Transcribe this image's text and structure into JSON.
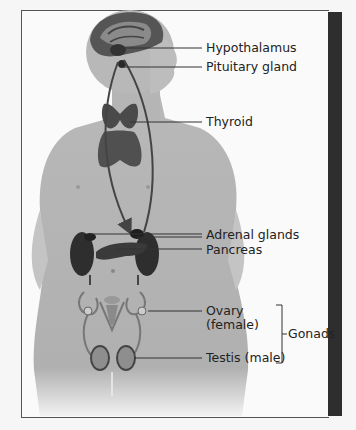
{
  "figure": {
    "type": "anatomical-diagram",
    "labels": {
      "hypothalamus": "Hypothalamus",
      "pituitary": "Pituitary gland",
      "thyroid": "Thyroid",
      "adrenal": "Adrenal glands",
      "pancreas": "Pancreas",
      "ovary_line1": "Ovary",
      "ovary_line2": "(female)",
      "testis": "Testis (male)",
      "gonads": "Gonads"
    }
  },
  "colors": {
    "frame_border": "#555555",
    "right_bar": "#2e2e2e",
    "skin": "#bdbdbd",
    "organ": "#3a3a3a",
    "leader_line": "#333333"
  }
}
